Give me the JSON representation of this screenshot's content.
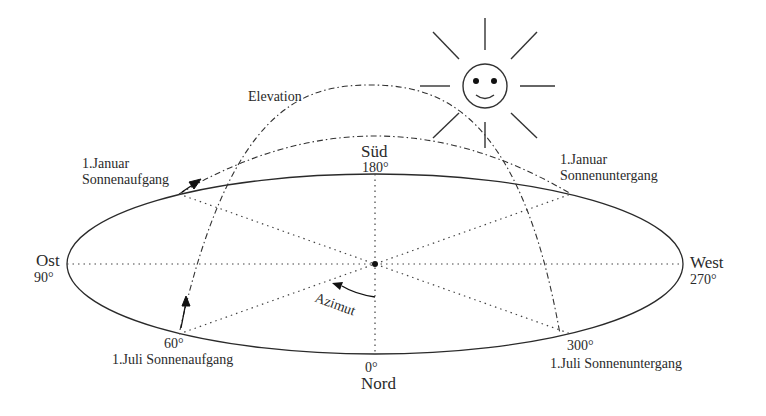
{
  "diagram": {
    "directions": {
      "north": {
        "name": "Nord",
        "deg": "0°"
      },
      "east": {
        "name": "Ost",
        "deg": "90°"
      },
      "south": {
        "name": "Süd",
        "deg": "180°"
      },
      "west": {
        "name": "West",
        "deg": "270°"
      }
    },
    "labels": {
      "elevation": "Elevation",
      "azimut": "Azimut",
      "jan_rise_line1": "1.Januar",
      "jan_rise_line2": "Sonnenaufgang",
      "jan_set_line1": "1.Januar",
      "jan_set_line2": "Sonnenuntergang",
      "jul_rise_deg": "60°",
      "jul_rise": "1.Juli Sonnenaufgang",
      "jul_set_deg": "300°",
      "jul_set": "1.Juli Sonnenuntergang"
    },
    "icons": [
      "sun-smiley-icon",
      "arrow-icon"
    ],
    "colors": {
      "line": "#2a2a2a",
      "background": "#ffffff"
    }
  }
}
